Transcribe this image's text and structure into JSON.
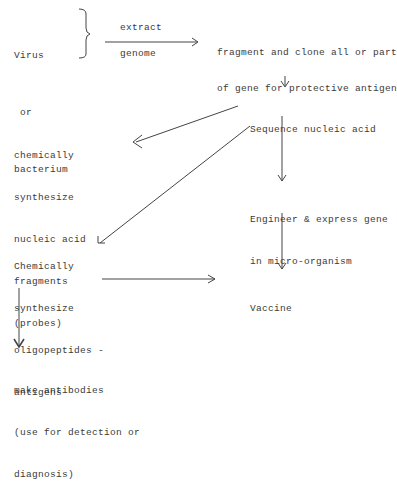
{
  "diagram": {
    "nodes": {
      "source": {
        "lines": [
          "Virus",
          " or",
          "bacterium"
        ]
      },
      "extract_label_top": "extract",
      "extract_label_bottom": "genome",
      "fragment": {
        "lines": [
          "fragment and clone all or part",
          "of gene for protective antigen"
        ]
      },
      "sequence": {
        "lines": [
          "Sequence nucleic acid"
        ]
      },
      "probes": {
        "lines": [
          "chemically",
          "synthesize",
          "nucleic acid",
          "fragments",
          "(probes)"
        ]
      },
      "engineer": {
        "lines": [
          "Engineer & express gene",
          "in micro-organism"
        ]
      },
      "oligopeptides": {
        "lines": [
          "Chemically",
          "synthesize",
          "oligopeptides -",
          "antigens"
        ]
      },
      "vaccine": {
        "lines": [
          "Vaccine"
        ]
      },
      "antibodies": {
        "lines": [
          "make antibodies",
          "(use for detection or",
          "diagnosis)"
        ]
      }
    },
    "edges": [
      {
        "from": "source",
        "to": "fragment",
        "label": "extract genome"
      },
      {
        "from": "fragment",
        "to": "sequence"
      },
      {
        "from": "sequence",
        "to": "probes"
      },
      {
        "from": "sequence",
        "to": "oligopeptides"
      },
      {
        "from": "sequence",
        "to": "engineer"
      },
      {
        "from": "engineer",
        "to": "vaccine"
      },
      {
        "from": "oligopeptides",
        "to": "vaccine"
      },
      {
        "from": "oligopeptides",
        "to": "antibodies"
      }
    ]
  }
}
